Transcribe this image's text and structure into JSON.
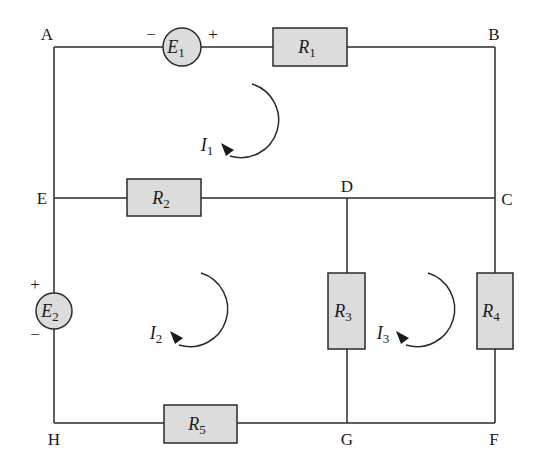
{
  "diagram": {
    "type": "circuit-schematic",
    "nodes": [
      {
        "id": "A",
        "label": "A"
      },
      {
        "id": "B",
        "label": "B"
      },
      {
        "id": "C",
        "label": "C"
      },
      {
        "id": "D",
        "label": "D"
      },
      {
        "id": "E",
        "label": "E"
      },
      {
        "id": "F",
        "label": "F"
      },
      {
        "id": "G",
        "label": "G"
      },
      {
        "id": "H",
        "label": "H"
      }
    ],
    "sources": [
      {
        "id": "E1",
        "symbol": "E",
        "sub": "1",
        "between": "A-B",
        "neg_sign": "−",
        "pos_sign": "+"
      },
      {
        "id": "E2",
        "symbol": "E",
        "sub": "2",
        "between": "E-H",
        "pos_sign": "+",
        "neg_sign": "−"
      }
    ],
    "resistors": [
      {
        "id": "R1",
        "symbol": "R",
        "sub": "1",
        "between": "A-B"
      },
      {
        "id": "R2",
        "symbol": "R",
        "sub": "2",
        "between": "E-D"
      },
      {
        "id": "R3",
        "symbol": "R",
        "sub": "3",
        "between": "D-G"
      },
      {
        "id": "R4",
        "symbol": "R",
        "sub": "4",
        "between": "C-F"
      },
      {
        "id": "R5",
        "symbol": "R",
        "sub": "5",
        "between": "H-G"
      }
    ],
    "loop_currents": [
      {
        "id": "I1",
        "symbol": "I",
        "sub": "1",
        "direction": "clockwise",
        "mesh": "A-B-C-D-E"
      },
      {
        "id": "I2",
        "symbol": "I",
        "sub": "2",
        "direction": "clockwise",
        "mesh": "E-D-G-H"
      },
      {
        "id": "I3",
        "symbol": "I",
        "sub": "3",
        "direction": "clockwise",
        "mesh": "D-C-F-G"
      }
    ],
    "colors": {
      "wire": "#2a2a2a",
      "component_fill": "#dcdcdc",
      "background": "#ffffff"
    }
  }
}
